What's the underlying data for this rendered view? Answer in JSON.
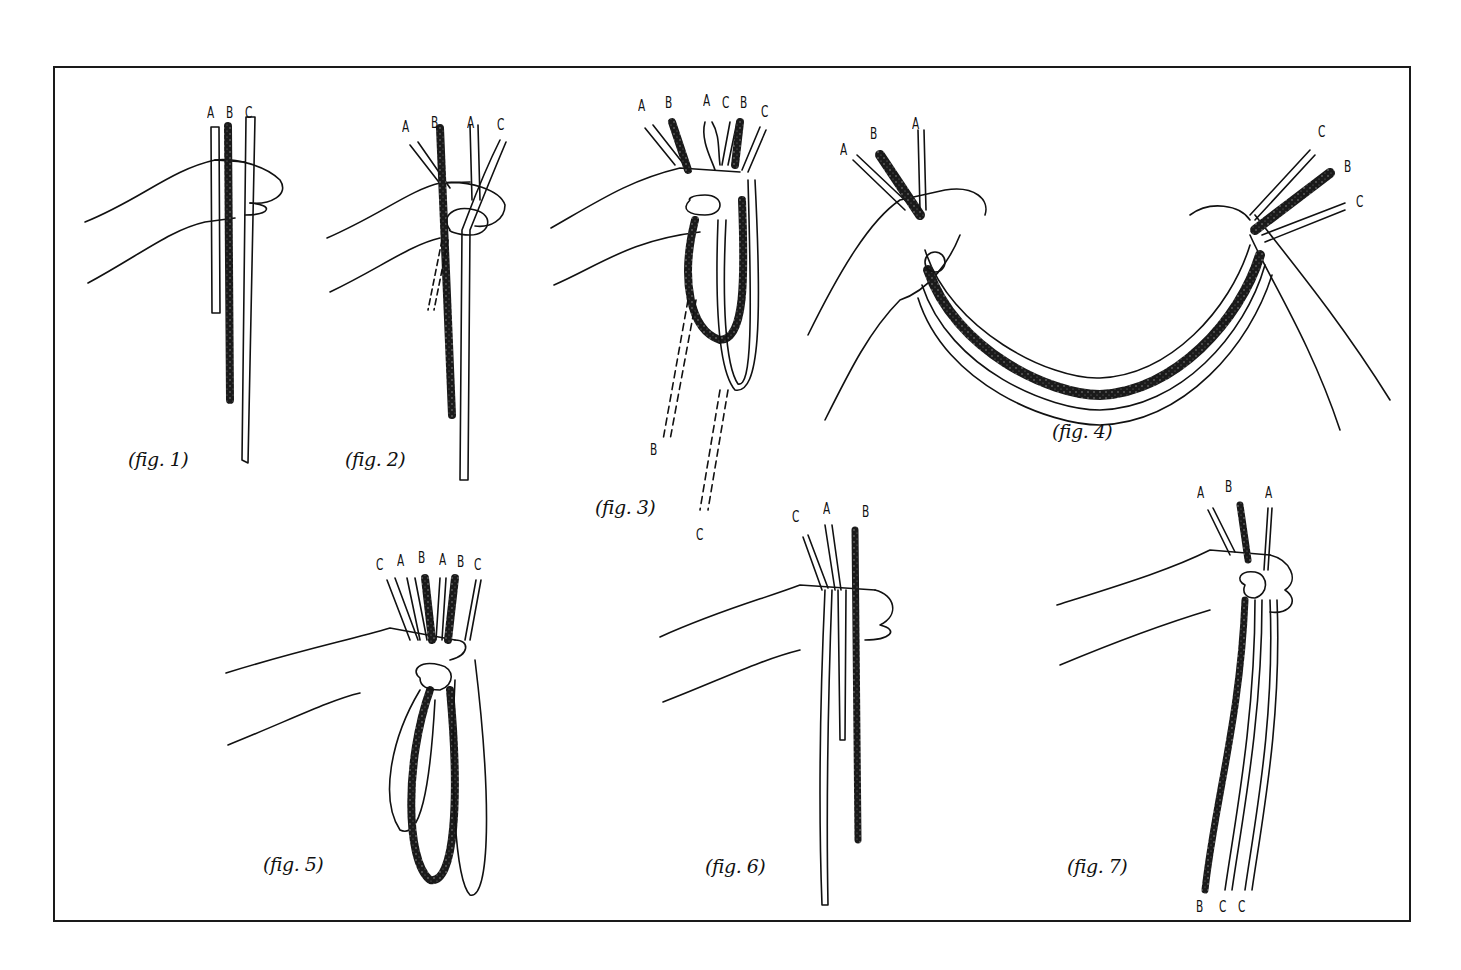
{
  "diagram": {
    "type": "instructional-illustration",
    "colors": {
      "frame": "#1a1a1a",
      "ink": "#111111",
      "strand_dark": "#1a1a1a",
      "background": "#ffffff"
    },
    "figures": [
      {
        "id": "fig1",
        "caption": "(fig. 1)",
        "top_labels": [
          "A",
          "B",
          "C"
        ],
        "bottom_labels": []
      },
      {
        "id": "fig2",
        "caption": "(fig. 2)",
        "top_labels": [
          "A",
          "B",
          "A",
          "C"
        ],
        "bottom_labels": []
      },
      {
        "id": "fig3",
        "caption": "(fig. 3)",
        "top_labels": [
          "A",
          "B",
          "A",
          "C",
          "B",
          "C"
        ],
        "bottom_labels": [
          "B",
          "C"
        ]
      },
      {
        "id": "fig4",
        "caption": "(fig. 4)",
        "top_labels": [
          "A",
          "B",
          "A"
        ],
        "right_labels": [
          "C",
          "B",
          "C"
        ],
        "bottom_labels": []
      },
      {
        "id": "fig5",
        "caption": "(fig. 5)",
        "top_labels": [
          "C",
          "A",
          "B",
          "A",
          "B",
          "C"
        ],
        "bottom_labels": []
      },
      {
        "id": "fig6",
        "caption": "(fig. 6)",
        "top_labels": [
          "C",
          "A",
          "B"
        ],
        "bottom_labels": []
      },
      {
        "id": "fig7",
        "caption": "(fig. 7)",
        "top_labels": [
          "A",
          "B",
          "A"
        ],
        "bottom_labels": [
          "B",
          "C",
          "C"
        ]
      }
    ]
  }
}
